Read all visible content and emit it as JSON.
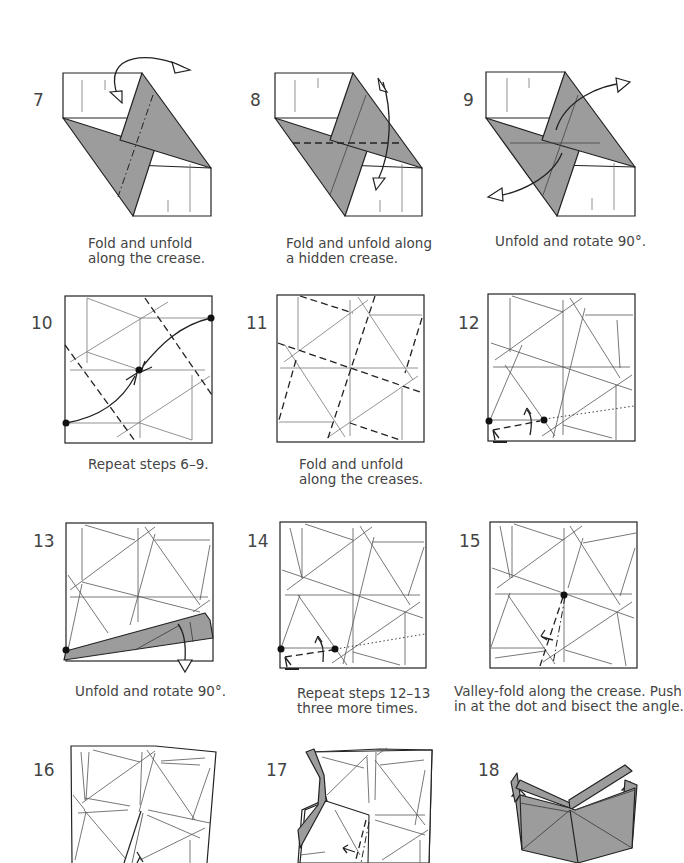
{
  "diagram": {
    "type": "origami-instructions",
    "colors": {
      "paper_colored": "#9c9c9c",
      "paper_white": "#ffffff",
      "lines": "#222222"
    },
    "steps": [
      {
        "number": "7",
        "caption": "Fold and unfold\nalong the crease."
      },
      {
        "number": "8",
        "caption": "Fold and unfold along\na hidden crease."
      },
      {
        "number": "9",
        "caption": "Unfold and rotate 90°."
      },
      {
        "number": "10",
        "caption": "Repeat steps 6–9."
      },
      {
        "number": "11",
        "caption": "Fold and unfold\nalong the creases."
      },
      {
        "number": "12",
        "caption": ""
      },
      {
        "number": "13",
        "caption": "Unfold and rotate 90°."
      },
      {
        "number": "14",
        "caption": "Repeat steps 12–13\nthree more times."
      },
      {
        "number": "15",
        "caption": "Valley-fold along the crease. Push\nin at the dot and bisect the angle."
      },
      {
        "number": "16",
        "caption": ""
      },
      {
        "number": "17",
        "caption": ""
      },
      {
        "number": "18",
        "caption": ""
      }
    ]
  }
}
